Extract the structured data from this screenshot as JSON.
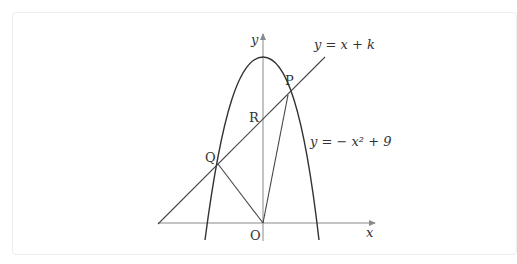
{
  "diagram": {
    "axes": {
      "x_label": "x",
      "y_label": "y",
      "origin_label": "O"
    },
    "curves": {
      "parabola_label": "y = − x² + 9",
      "line_label": "y = x + k"
    },
    "points": {
      "P": "P",
      "Q": "Q",
      "R": "R"
    },
    "colors": {
      "stroke": "#333333",
      "axis": "#8a8a8a",
      "frame": "#ededed"
    }
  }
}
